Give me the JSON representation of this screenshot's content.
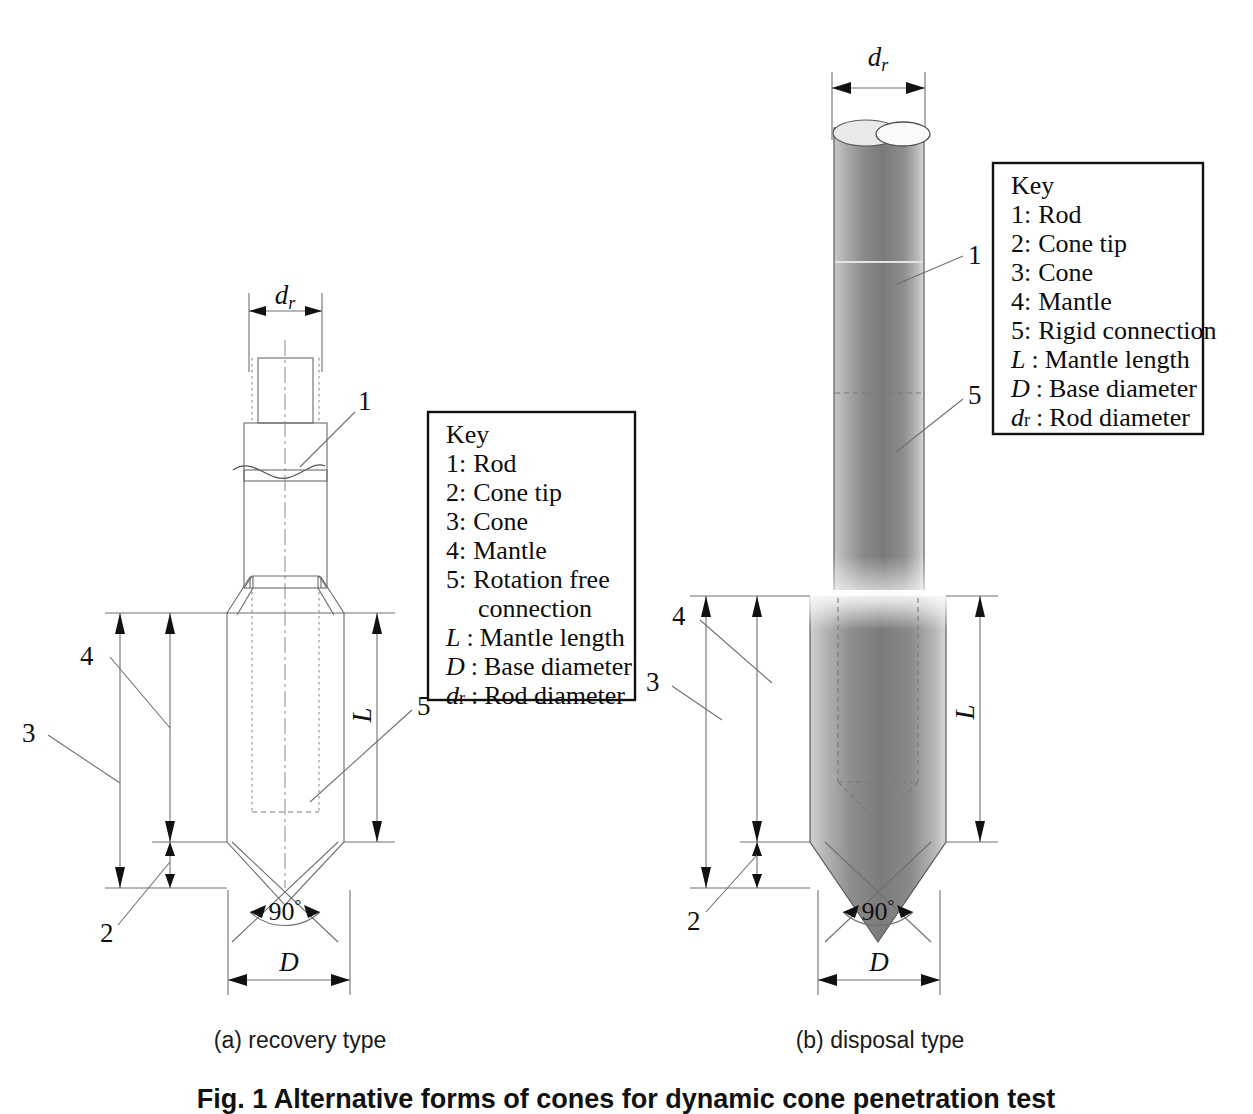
{
  "figure": {
    "caption": "Fig. 1 Alternative forms of cones for dynamic cone penetration test",
    "subcaptions": [
      {
        "id": "a",
        "label": "(a) recovery type"
      },
      {
        "id": "b",
        "label": "(b) disposal type"
      }
    ]
  },
  "diagram_a": {
    "name": "recovery-type-cone",
    "callouts": [
      {
        "id": "1",
        "label": "1",
        "refers_to": "Rod"
      },
      {
        "id": "2",
        "label": "2",
        "refers_to": "Cone tip"
      },
      {
        "id": "3",
        "label": "3",
        "refers_to": "Cone"
      },
      {
        "id": "4",
        "label": "4",
        "refers_to": "Mantle"
      },
      {
        "id": "5",
        "label": "5",
        "refers_to": "Rotation free connection"
      }
    ],
    "dimensions": [
      {
        "symbol": "d",
        "subscript": "r",
        "meaning": "Rod diameter"
      },
      {
        "symbol": "L",
        "subscript": "",
        "meaning": "Mantle length"
      },
      {
        "symbol": "D",
        "subscript": "",
        "meaning": "Base diameter"
      }
    ],
    "angle": "90",
    "angle_unit": "°"
  },
  "diagram_b": {
    "name": "disposal-type-cone",
    "callouts": [
      {
        "id": "1",
        "label": "1",
        "refers_to": "Rod"
      },
      {
        "id": "2",
        "label": "2",
        "refers_to": "Cone tip"
      },
      {
        "id": "3",
        "label": "3",
        "refers_to": "Cone"
      },
      {
        "id": "4",
        "label": "4",
        "refers_to": "Mantle"
      },
      {
        "id": "5",
        "label": "5",
        "refers_to": "Rigid connection"
      }
    ],
    "dimensions": [
      {
        "symbol": "d",
        "subscript": "r",
        "meaning": "Rod diameter"
      },
      {
        "symbol": "L",
        "subscript": "",
        "meaning": "Mantle length"
      },
      {
        "symbol": "D",
        "subscript": "",
        "meaning": "Base diameter"
      }
    ],
    "angle": "90",
    "angle_unit": "°"
  },
  "key_a": {
    "title": "Key",
    "entries": [
      {
        "num": "1:",
        "text": "Rod",
        "italic_sym": ""
      },
      {
        "num": "2:",
        "text": "Cone tip",
        "italic_sym": ""
      },
      {
        "num": "3:",
        "text": "Cone",
        "italic_sym": ""
      },
      {
        "num": "4:",
        "text": "Mantle",
        "italic_sym": ""
      },
      {
        "num": "5:",
        "text": "Rotation free",
        "italic_sym": ""
      },
      {
        "num": "",
        "text": "connection",
        "italic_sym": ""
      },
      {
        "num": ":",
        "text": "Mantle length",
        "italic_sym": "L"
      },
      {
        "num": ":",
        "text": "Base diameter",
        "italic_sym": "D"
      },
      {
        "num": ":",
        "text": "Rod diameter",
        "italic_sym": "dr"
      }
    ]
  },
  "key_b": {
    "title": "Key",
    "entries": [
      {
        "num": "1:",
        "text": "Rod",
        "italic_sym": ""
      },
      {
        "num": "2:",
        "text": "Cone tip",
        "italic_sym": ""
      },
      {
        "num": "3:",
        "text": "Cone",
        "italic_sym": ""
      },
      {
        "num": "4:",
        "text": "Mantle",
        "italic_sym": ""
      },
      {
        "num": "5:",
        "text": "Rigid connection",
        "italic_sym": ""
      },
      {
        "num": ":",
        "text": "Mantle length",
        "italic_sym": "L"
      },
      {
        "num": ":",
        "text": "Base diameter",
        "italic_sym": "D"
      },
      {
        "num": ":",
        "text": "Rod diameter",
        "italic_sym": "dr"
      }
    ]
  },
  "labels": {
    "dr": "d",
    "dr_sub": "r",
    "L": "L",
    "D": "D",
    "angle90": "90",
    "degree": "°",
    "n1": "1",
    "n2": "2",
    "n3": "3",
    "n4": "4",
    "n5": "5"
  },
  "colors": {
    "background": "#ffffff",
    "line": "#6b6b6b",
    "text": "#111111",
    "keybox_border": "#111111",
    "metal_light": "#d9d9d9",
    "metal_mid": "#8f8f8f",
    "metal_dark": "#6e6e6e"
  }
}
